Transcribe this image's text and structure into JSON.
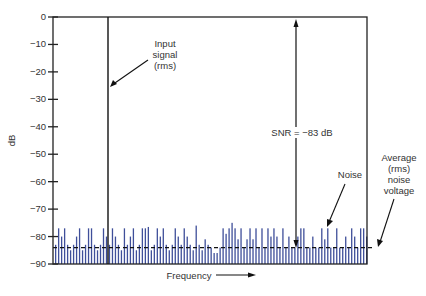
{
  "chart_data": {
    "type": "bar",
    "title": "",
    "xlabel": "Frequency",
    "ylabel": "dB",
    "ylim": [
      -90,
      0
    ],
    "yticks": [
      0,
      -10,
      -20,
      -30,
      -40,
      -50,
      -60,
      -70,
      -80,
      -90
    ],
    "ytick_labels": [
      "0",
      "−10",
      "−20",
      "−30",
      "−40",
      "−50",
      "−60",
      "−70",
      "−80",
      "−90"
    ],
    "grid": false,
    "series": [
      {
        "name": "Input signal (rms)",
        "type": "line",
        "x_fraction": 0.175,
        "value": 0
      },
      {
        "name": "Noise",
        "type": "bar",
        "color": "#3f4f9a",
        "values": [
          -83,
          -77,
          -80,
          -77,
          -83,
          -85,
          -83,
          -80,
          -77,
          -85,
          -83,
          -77,
          -77,
          -83,
          -85,
          -83,
          -77,
          -80,
          -83,
          -77,
          -80,
          -83,
          -85,
          -77,
          -83,
          -80,
          -77,
          -85,
          -83,
          -77,
          -77,
          -76.5,
          -85,
          -83,
          -77,
          -80,
          -77,
          -83,
          -85,
          -83,
          -77,
          -80,
          -83,
          -77,
          -80,
          -83,
          -85,
          -76,
          -83,
          -85,
          -81,
          -83,
          -84,
          -86,
          -86,
          -84,
          -77,
          -79,
          -77,
          -75,
          -77,
          -81,
          -77,
          -84,
          -81,
          -77,
          -81,
          -77,
          -84,
          -77,
          -84,
          -77,
          -80,
          -77,
          -80,
          -84,
          -77,
          -84,
          -80,
          -84,
          -84,
          -80,
          -77,
          -77,
          -84,
          -84,
          -80,
          -84,
          -84,
          -77,
          -81,
          -77,
          -84,
          -84,
          -77,
          -84,
          -84,
          -80,
          -84,
          -77,
          -80,
          -84,
          -77,
          -77,
          -80
        ]
      },
      {
        "name": "Average (rms) noise voltage",
        "type": "hline",
        "value": -84,
        "style": "dashed"
      }
    ],
    "annotations": [
      {
        "text": "Input signal (rms)",
        "points_to": "input signal line"
      },
      {
        "text": "SNR = −83 dB",
        "arrow": "double-headed from -84 dB to 0 dB"
      },
      {
        "text": "Noise",
        "points_to": "noise bars"
      },
      {
        "text": "Average (rms) noise voltage",
        "points_to": "dashed average line"
      }
    ]
  },
  "labels": {
    "ylabel": "dB",
    "xlabel": "Frequency",
    "input_signal": [
      "Input",
      "signal",
      "(rms)"
    ],
    "snr": "SNR = −83 dB",
    "noise": "Noise",
    "average": [
      "Average",
      "(rms)",
      "noise",
      "voltage"
    ]
  },
  "colors": {
    "axis": "#222222",
    "noise_bar": "#3f4f9a",
    "text": "#333333"
  }
}
